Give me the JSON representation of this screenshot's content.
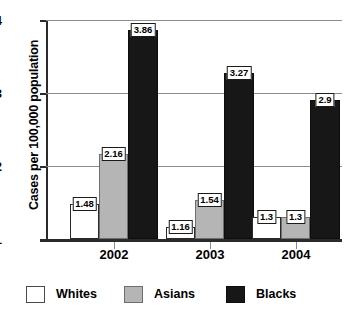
{
  "chart_data": {
    "type": "bar",
    "title": "",
    "xlabel": "",
    "ylabel": "Cases per 100,000 population",
    "categories": [
      "2002",
      "2003",
      "2004"
    ],
    "series": [
      {
        "name": "Whites",
        "color": "#ffffff",
        "values": [
          1.48,
          1.16,
          1.3
        ]
      },
      {
        "name": "Asians",
        "color": "#b5b5b5",
        "values": [
          2.16,
          1.54,
          1.3
        ]
      },
      {
        "name": "Blacks",
        "color": "#171717",
        "values": [
          3.86,
          3.27,
          2.9
        ]
      }
    ],
    "value_labels": [
      [
        "1.48",
        "1.16",
        "1.3"
      ],
      [
        "2.16",
        "1.54",
        "1.3"
      ],
      [
        "3.86",
        "3.27",
        "2.9"
      ]
    ],
    "ylim": [
      1,
      4
    ],
    "yticks": [
      "1",
      "2",
      "3",
      "4"
    ],
    "grid": true,
    "legend_position": "bottom"
  },
  "axes": {
    "y_title": "Cases per 100,000 population",
    "y_tick_1": "1",
    "y_tick_2": "2",
    "y_tick_3": "3",
    "y_tick_4": "4",
    "x_label_0": "2002",
    "x_label_1": "2003",
    "x_label_2": "2004"
  },
  "legend": {
    "whites": "Whites",
    "asians": "Asians",
    "blacks": "Blacks"
  },
  "labels": {
    "g0_whites": "1.48",
    "g0_asians": "2.16",
    "g0_blacks": "3.86",
    "g1_whites": "1.16",
    "g1_asians": "1.54",
    "g1_blacks": "3.27",
    "g2_whites": "1.3",
    "g2_asians": "1.3",
    "g2_blacks": "2.9"
  }
}
